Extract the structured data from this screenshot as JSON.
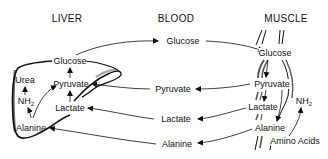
{
  "diagram": {
    "columns": {
      "liver": {
        "title": "LIVER"
      },
      "blood": {
        "title": "BLOOD"
      },
      "muscle": {
        "title": "MUSCLE"
      }
    },
    "liver": {
      "glucose": "Glucose",
      "pyruvate": "Pyruvate",
      "lactate": "Lactate",
      "alanine": "Alanine",
      "urea": "Urea",
      "nh2": "NH",
      "nh2_sub": "2"
    },
    "blood": {
      "glucose": "Glucose",
      "pyruvate": "Pyruvate",
      "lactate": "Lactate",
      "alanine": "Alanine"
    },
    "muscle": {
      "glucose": "Glucose",
      "pyruvate": "Pyruvate",
      "lactate": "Lactate",
      "alanine": "Alanine",
      "nh2": "NH",
      "nh2_sub": "2",
      "amino_acids": "Amino Acids"
    },
    "flows": [
      {
        "from": "liver.glucose",
        "to": "blood.glucose"
      },
      {
        "from": "blood.glucose",
        "to": "muscle.glucose"
      },
      {
        "from": "muscle.pyruvate",
        "to": "blood.pyruvate"
      },
      {
        "from": "blood.pyruvate",
        "to": "liver.pyruvate"
      },
      {
        "from": "muscle.lactate",
        "to": "blood.lactate"
      },
      {
        "from": "blood.lactate",
        "to": "liver.lactate"
      },
      {
        "from": "muscle.alanine",
        "to": "blood.alanine"
      },
      {
        "from": "blood.alanine",
        "to": "liver.alanine"
      },
      {
        "from": "liver.pyruvate",
        "to": "liver.glucose"
      },
      {
        "from": "liver.lactate",
        "to": "liver.pyruvate"
      },
      {
        "from": "liver.alanine",
        "to": "liver.nh2"
      },
      {
        "from": "liver.alanine",
        "to": "liver.pyruvate"
      },
      {
        "from": "liver.nh2",
        "to": "liver.urea"
      },
      {
        "from": "muscle.glucose",
        "to": "muscle.pyruvate"
      },
      {
        "from": "muscle.pyruvate",
        "to": "muscle.lactate"
      },
      {
        "from": "muscle.pyruvate",
        "to": "muscle.alanine"
      },
      {
        "from": "muscle.amino_acids",
        "to": "muscle.nh2"
      }
    ]
  }
}
